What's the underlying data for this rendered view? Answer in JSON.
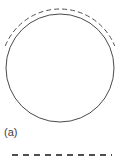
{
  "figure": {
    "panel_label": "(a)",
    "background_color": "#ffffff",
    "stroke_color": "#4a4a4a",
    "dashed_stroke_color": "#4f4f4f",
    "canvas": {
      "width": 124,
      "height": 164
    },
    "elements": {
      "circle": {
        "name": "solid circle outline",
        "center_x": 60,
        "center_y": 68,
        "radius": 54,
        "stroke_width": 1,
        "style": "solid",
        "fill": "none"
      },
      "dashed_arc": {
        "name": "dashed arc over upper circle",
        "center_x": 60,
        "center_y": 68,
        "radius": 59,
        "start_angle_deg": 202,
        "end_angle_deg": 338,
        "stroke_width": 1,
        "style": "dashed",
        "dash_pattern": "5 3"
      },
      "legend_rule": {
        "name": "dashed horizontal rule",
        "x1": 12,
        "x2": 112,
        "y": 155,
        "stroke_width": 2,
        "style": "dashed",
        "dash_pattern": "6 5"
      }
    }
  }
}
